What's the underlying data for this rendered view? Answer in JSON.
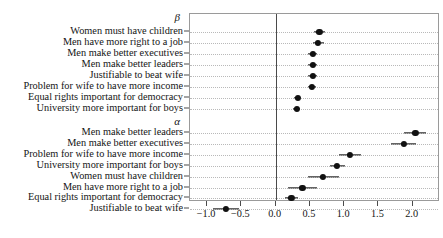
{
  "chart_data": {
    "type": "scatter",
    "title": "",
    "xlabel": "",
    "ylabel": "",
    "xlim": [
      -1.25,
      2.4
    ],
    "xticks": [
      -1.0,
      -0.5,
      0.0,
      0.5,
      1.0,
      1.5,
      2.0
    ],
    "xticklabels": [
      "−1.0",
      "−0.5",
      "0.0",
      "0.5",
      "1.0",
      "1.5",
      "2.0"
    ],
    "grid": true,
    "legend": null,
    "reference_line": 0.0,
    "orientation": "horizontal",
    "marker": "filled-circle-with-error-bars",
    "panels": [
      {
        "name": "beta",
        "label": "β",
        "categories": [
          "Women must have children",
          "Men have more right to a job",
          "Men make better executives",
          "Men make better leaders",
          "Justifiable to beat wife",
          "Problem for wife to have more income",
          "Equal rights important for democracy",
          "University more important for boys"
        ],
        "values": [
          0.64,
          0.62,
          0.54,
          0.54,
          0.54,
          0.53,
          0.32,
          0.31
        ],
        "ci_low": [
          0.56,
          0.54,
          0.48,
          0.48,
          0.48,
          0.47,
          0.27,
          0.26
        ],
        "ci_high": [
          0.72,
          0.7,
          0.6,
          0.6,
          0.6,
          0.59,
          0.37,
          0.36
        ]
      },
      {
        "name": "alpha",
        "label": "α",
        "categories": [
          "Men make better leaders",
          "Men make better executives",
          "Problem for wife to have more income",
          "University more important for boys",
          "Women must have children",
          "Men have more right to a job",
          "Equal rights important for democracy",
          "Justifiable to beat wife"
        ],
        "values": [
          2.04,
          1.87,
          1.08,
          0.9,
          0.69,
          0.39,
          0.23,
          -0.72
        ],
        "ci_low": [
          1.88,
          1.69,
          0.92,
          0.79,
          0.47,
          0.18,
          0.14,
          -0.92
        ],
        "ci_high": [
          2.19,
          2.05,
          1.25,
          1.01,
          0.92,
          0.6,
          0.33,
          -0.53
        ]
      }
    ]
  }
}
